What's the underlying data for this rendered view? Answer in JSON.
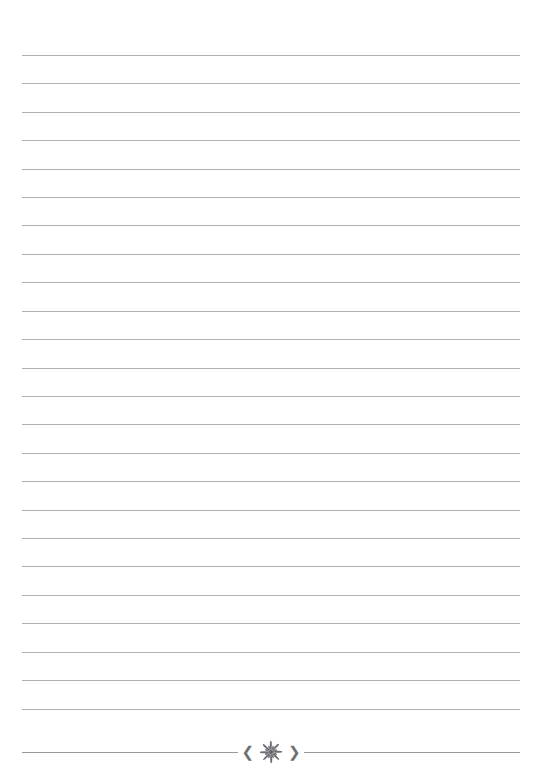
{
  "page": {
    "kind": "lined-stationery-page",
    "width_px": 542,
    "height_px": 783,
    "background_color": "#ffffff",
    "paper_label": "",
    "content_text": ""
  },
  "rules": {
    "label": "",
    "line_color": "#a8a9ad",
    "line_thickness_px": 1,
    "count": 24,
    "first_line_y_px": 55,
    "line_spacing_px": 28.4,
    "margin_left_px": 22,
    "margin_right_px": 22,
    "line_length_px": 498,
    "lines": [
      {
        "index": 1,
        "y_px": 55,
        "text": ""
      },
      {
        "index": 2,
        "y_px": 83,
        "text": ""
      },
      {
        "index": 3,
        "y_px": 112,
        "text": ""
      },
      {
        "index": 4,
        "y_px": 140,
        "text": ""
      },
      {
        "index": 5,
        "y_px": 169,
        "text": ""
      },
      {
        "index": 6,
        "y_px": 197,
        "text": ""
      },
      {
        "index": 7,
        "y_px": 225,
        "text": ""
      },
      {
        "index": 8,
        "y_px": 254,
        "text": ""
      },
      {
        "index": 9,
        "y_px": 282,
        "text": ""
      },
      {
        "index": 10,
        "y_px": 311,
        "text": ""
      },
      {
        "index": 11,
        "y_px": 339,
        "text": ""
      },
      {
        "index": 12,
        "y_px": 368,
        "text": ""
      },
      {
        "index": 13,
        "y_px": 396,
        "text": ""
      },
      {
        "index": 14,
        "y_px": 424,
        "text": ""
      },
      {
        "index": 15,
        "y_px": 453,
        "text": ""
      },
      {
        "index": 16,
        "y_px": 481,
        "text": ""
      },
      {
        "index": 17,
        "y_px": 510,
        "text": ""
      },
      {
        "index": 18,
        "y_px": 538,
        "text": ""
      },
      {
        "index": 19,
        "y_px": 566,
        "text": ""
      },
      {
        "index": 20,
        "y_px": 595,
        "text": ""
      },
      {
        "index": 21,
        "y_px": 623,
        "text": ""
      },
      {
        "index": 22,
        "y_px": 652,
        "text": ""
      },
      {
        "index": 23,
        "y_px": 680,
        "text": ""
      },
      {
        "index": 24,
        "y_px": 709,
        "text": ""
      }
    ]
  },
  "footer": {
    "label": "",
    "rule_y_px": 752,
    "rule_color": "#97989d",
    "ornament_color": "#6e6f74",
    "ornament": {
      "name": "floral-starburst-divider",
      "left_chevron": "❮",
      "right_chevron": "❯",
      "petal_count": 8,
      "ray_count": 8,
      "center_dot": true
    }
  }
}
